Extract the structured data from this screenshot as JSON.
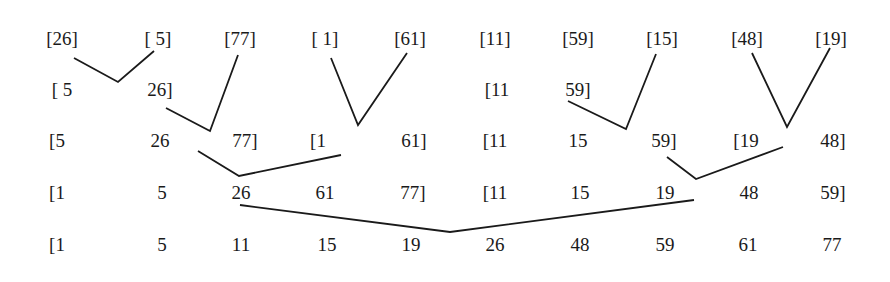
{
  "rows": [
    {
      "y": 38,
      "cells": [
        {
          "x": 62,
          "text": "[26]"
        },
        {
          "x": 158,
          "text": "[ 5]"
        },
        {
          "x": 240,
          "text": "[77]"
        },
        {
          "x": 325,
          "text": "[ 1]"
        },
        {
          "x": 410,
          "text": "[61]"
        },
        {
          "x": 495,
          "text": "[11]"
        },
        {
          "x": 578,
          "text": "[59]"
        },
        {
          "x": 662,
          "text": "[15]"
        },
        {
          "x": 747,
          "text": "[48]"
        },
        {
          "x": 831,
          "text": "[19]"
        }
      ]
    },
    {
      "y": 89,
      "cells": [
        {
          "x": 62,
          "text": "[ 5"
        },
        {
          "x": 160,
          "text": "26]"
        },
        {
          "x": 497,
          "text": "[11"
        },
        {
          "x": 578,
          "text": "59]"
        }
      ]
    },
    {
      "y": 140,
      "cells": [
        {
          "x": 57,
          "text": "[5"
        },
        {
          "x": 160,
          "text": "26"
        },
        {
          "x": 245,
          "text": "77]"
        },
        {
          "x": 318,
          "text": "[1"
        },
        {
          "x": 414,
          "text": "61]"
        },
        {
          "x": 495,
          "text": "[11"
        },
        {
          "x": 578,
          "text": "15"
        },
        {
          "x": 664,
          "text": "59]"
        },
        {
          "x": 746,
          "text": "[19"
        },
        {
          "x": 833,
          "text": "48]"
        }
      ]
    },
    {
      "y": 192,
      "cells": [
        {
          "x": 57,
          "text": "[1"
        },
        {
          "x": 162,
          "text": "5"
        },
        {
          "x": 241,
          "text": "26"
        },
        {
          "x": 325,
          "text": "61"
        },
        {
          "x": 413,
          "text": "77]"
        },
        {
          "x": 495,
          "text": "[11"
        },
        {
          "x": 580,
          "text": "15"
        },
        {
          "x": 665,
          "text": "19"
        },
        {
          "x": 749,
          "text": "48"
        },
        {
          "x": 833,
          "text": "59]"
        }
      ]
    },
    {
      "y": 244,
      "cells": [
        {
          "x": 57,
          "text": "[1"
        },
        {
          "x": 162,
          "text": "5"
        },
        {
          "x": 241,
          "text": "11"
        },
        {
          "x": 327,
          "text": "15"
        },
        {
          "x": 411,
          "text": "19"
        },
        {
          "x": 495,
          "text": "26"
        },
        {
          "x": 580,
          "text": "48"
        },
        {
          "x": 665,
          "text": "59"
        },
        {
          "x": 748,
          "text": "61"
        },
        {
          "x": 832,
          "text": "77"
        }
      ]
    }
  ],
  "merge_lines": [
    "74,58 118,82 154,51",
    "166,108 210,131 238,55",
    "331,58 358,125 407,53",
    "568,101 626,129 656,54",
    "752,53 787,127 830,48",
    "198,151 239,176 341,155",
    "667,157 696,179 783,147",
    "240,205 450,232 694,200"
  ]
}
